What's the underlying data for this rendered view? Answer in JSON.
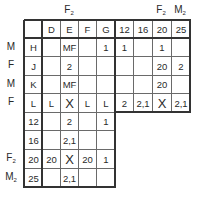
{
  "top_labels": [
    {
      "text": "F",
      "sub": "2",
      "col": 2
    },
    {
      "text": "F",
      "sub": "2",
      "col": 7
    },
    {
      "text": "M",
      "sub": "2",
      "col": 8
    }
  ],
  "header_row": [
    "",
    "D",
    "E",
    "F",
    "G",
    "12",
    "16",
    "20",
    "25"
  ],
  "rows": [
    {
      "side": "M",
      "side_sub": "",
      "cells": [
        "H",
        "",
        "MF",
        "",
        "1",
        "1",
        "",
        "1",
        ""
      ]
    },
    {
      "side": "F",
      "side_sub": "",
      "cells": [
        "J",
        "",
        "2",
        "",
        "",
        "",
        "",
        "20",
        "2"
      ]
    },
    {
      "side": "M",
      "side_sub": "",
      "cells": [
        "K",
        "",
        "MF",
        "",
        "",
        "",
        "",
        "20",
        ""
      ]
    },
    {
      "side": "F",
      "side_sub": "",
      "cells": [
        "L",
        "L",
        "X",
        "L",
        "L",
        "2",
        "2,1",
        "X",
        "2,1"
      ]
    },
    {
      "side": "",
      "side_sub": "",
      "cells": [
        "12",
        "",
        "2",
        "",
        "1"
      ]
    },
    {
      "side": "",
      "side_sub": "",
      "cells": [
        "16",
        "",
        "2,1",
        "",
        ""
      ]
    },
    {
      "side": "F",
      "side_sub": "2",
      "cells": [
        "20",
        "20",
        "X",
        "20",
        "1"
      ]
    },
    {
      "side": "M",
      "side_sub": "2",
      "cells": [
        "25",
        "",
        "2,1",
        "",
        ""
      ]
    }
  ]
}
